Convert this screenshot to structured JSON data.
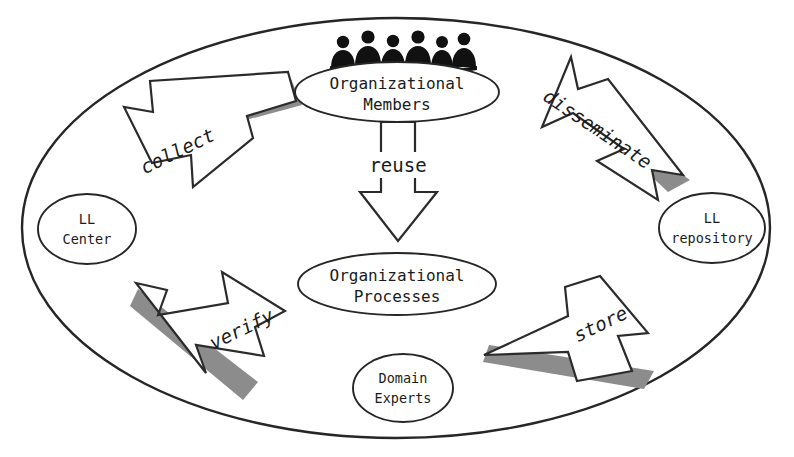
{
  "diagram": {
    "colors": {
      "background": "#ffffff",
      "outline": "#262626",
      "arrow_fill": "#ffffff",
      "arrow_outline": "#2b2b2b",
      "arrow_shadow": "#8c8c8c",
      "text": "#1b1b1b",
      "people": "#111111"
    },
    "outer_boundary": {
      "shape": "ellipse",
      "cx": 396,
      "cy": 228,
      "rx": 374,
      "ry": 210
    },
    "nodes": [
      {
        "id": "organizational-members",
        "label_line1": "Organizational",
        "label_line2": "Members",
        "cx": 397,
        "cy": 92,
        "rx": 102,
        "ry": 30,
        "decoration": "group-of-people"
      },
      {
        "id": "organizational-processes",
        "label_line1": "Organizational",
        "label_line2": "Processes",
        "cx": 397,
        "cy": 284,
        "rx": 99,
        "ry": 31,
        "decoration": "none"
      },
      {
        "id": "ll-center",
        "label_line1": "LL",
        "label_line2": "Center",
        "cx": 87,
        "cy": 229,
        "rx": 49,
        "ry": 35,
        "decoration": "none"
      },
      {
        "id": "ll-repository",
        "label_line1": "LL",
        "label_line2": "repository",
        "cx": 712,
        "cy": 228,
        "rx": 53,
        "ry": 35,
        "decoration": "none"
      },
      {
        "id": "domain-experts",
        "label_line1": "Domain",
        "label_line2": "Experts",
        "cx": 403,
        "cy": 388,
        "rx": 50,
        "ry": 34,
        "decoration": "none"
      }
    ],
    "arrows": [
      {
        "id": "collect",
        "label": "collect",
        "from": "organizational-members",
        "to": "ll-center",
        "direction": "down-left",
        "label_x": 178,
        "label_y": 152,
        "label_rotation": -26
      },
      {
        "id": "disseminate",
        "label": "disseminate",
        "from": "ll-repository",
        "to": "organizational-members",
        "direction": "up-left",
        "label_x": 597,
        "label_y": 130,
        "label_rotation": 34
      },
      {
        "id": "reuse",
        "label": "reuse",
        "from": "organizational-members",
        "to": "organizational-processes",
        "direction": "down",
        "label_x": 398,
        "label_y": 165,
        "label_rotation": 0
      },
      {
        "id": "verify",
        "label": "verify",
        "from": "ll-center",
        "to": "domain-experts",
        "direction": "down-right",
        "label_x": 242,
        "label_y": 330,
        "label_rotation": -26
      },
      {
        "id": "store",
        "label": "store",
        "from": "domain-experts",
        "to": "ll-repository",
        "direction": "up-right",
        "label_x": 601,
        "label_y": 325,
        "label_rotation": -26
      }
    ],
    "cropped_header_text": ""
  }
}
